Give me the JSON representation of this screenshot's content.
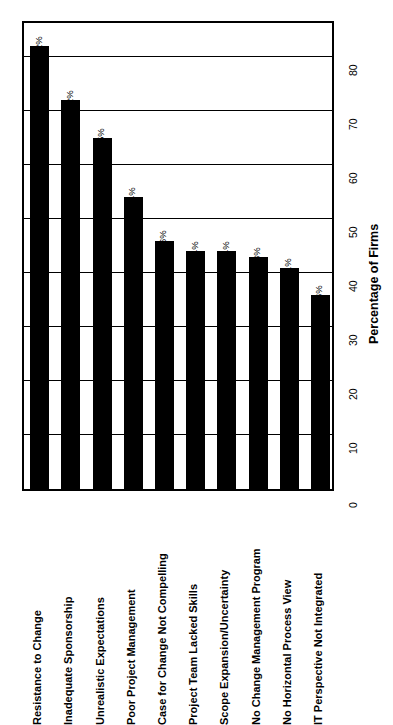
{
  "chart_data": {
    "type": "bar",
    "title": "",
    "subtitle": "",
    "orientation": "rotated-90",
    "xlabel": "",
    "ylabel": "Percentage of Firms",
    "ylim": [
      0,
      87
    ],
    "ytick_values": [
      0,
      10,
      20,
      30,
      40,
      50,
      60,
      70,
      80
    ],
    "ytick_labels": [
      "0",
      "10",
      "20",
      "30",
      "40",
      "50",
      "60",
      "70",
      "80"
    ],
    "grid": true,
    "legend": false,
    "legend_position": "none",
    "bar_color": "#000000",
    "frame_color": "#000000",
    "background_color": "#ffffff",
    "categories": [
      "Resistance to Change",
      "Inadequate Sponsorship",
      "Unrealistic Expectations",
      "Poor Project Management",
      "Case for Change Not Compelling",
      "Project Team Lacked Skills",
      "Scope Expansion/Uncertainty",
      "No Change Management Program",
      "No Horizontal Process View",
      "IT Perspective Not Integrated"
    ],
    "values": [
      82,
      72,
      65,
      54,
      46,
      44,
      44,
      43,
      41,
      36
    ],
    "value_labels": [
      "82%",
      "72%",
      "65%",
      "54%",
      "46%",
      "44%",
      "44%",
      "43%",
      "41%",
      "36%"
    ]
  }
}
